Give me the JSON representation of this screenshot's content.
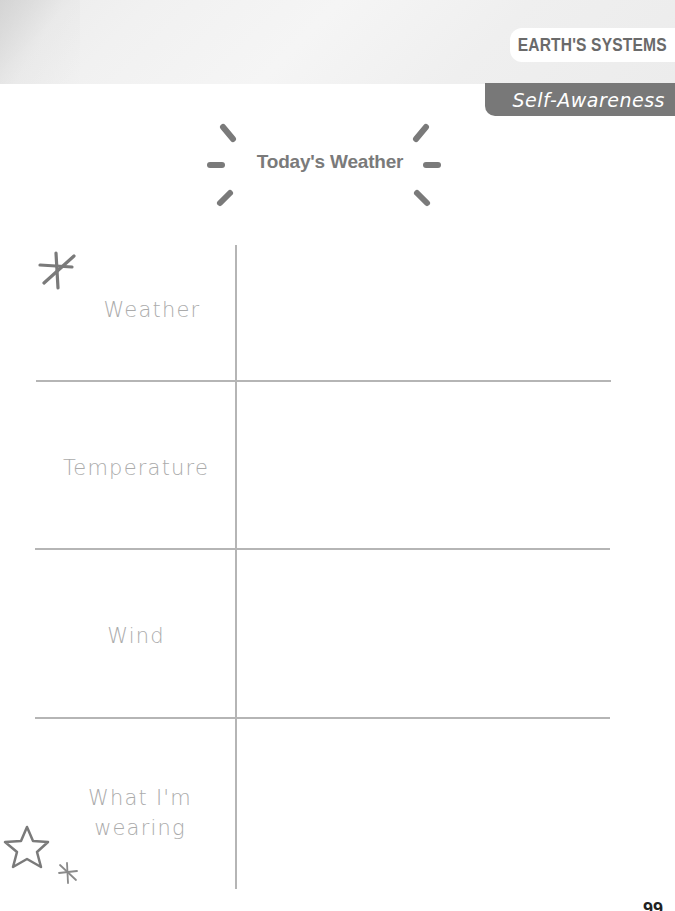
{
  "header": {
    "subject": "EARTH'S SYSTEMS",
    "skill": "Self-Awareness"
  },
  "title": "Today's Weather",
  "table": {
    "rows": [
      {
        "label": "Weather",
        "value": ""
      },
      {
        "label": "Temperature",
        "value": ""
      },
      {
        "label": "Wind",
        "value": ""
      },
      {
        "label_line1": "What I'm",
        "label_line2": "wearing",
        "value": ""
      }
    ]
  },
  "decorations": {
    "top_left": "asterisk-icon",
    "bottom_left_star": "star-outline-icon",
    "bottom_left_small": "small-asterisk-icon",
    "title_rays": "sun-rays-icon"
  },
  "colors": {
    "line": "#b5b5b5",
    "label_text": "#ababab",
    "title_text": "#7a7a7a",
    "skill_tab_bg": "#787878",
    "subject_text": "#6a6a6a"
  },
  "footer": {
    "page_number": "99"
  }
}
